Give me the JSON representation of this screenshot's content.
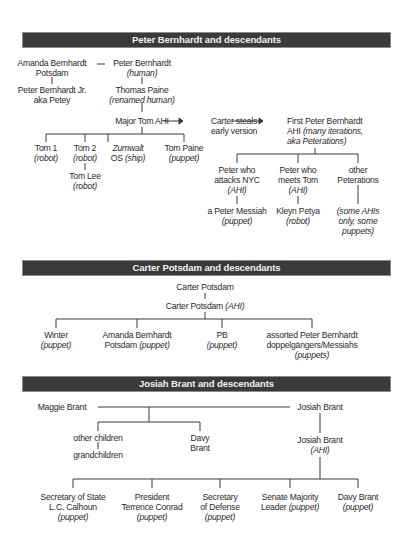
{
  "sections": [
    {
      "title": "Peter Bernhardt and descendants",
      "nodes": {
        "amanda": {
          "line1": "Amanda Bernhardt",
          "line2": "Potsdam"
        },
        "peter": {
          "line1": "Peter Bernhardt",
          "line2": "(human)"
        },
        "peter_jr": {
          "line1": "Peter Bernhardt Jr.",
          "line2": "aka Petey"
        },
        "thomas_paine": {
          "line1": "Thomas Paine",
          "line2": "(renamed human)"
        },
        "major_tom": {
          "line1": "Major Tom AHI"
        },
        "carter_steals": {
          "line1": "Carter steals",
          "line2": "early version"
        },
        "first_peter": {
          "line1": "First Peter Bernhardt",
          "line2a": "AHI ",
          "line2b": "(many iterations,",
          "line3": "aka Peterations)"
        },
        "tom1": {
          "line1": "Tom 1",
          "line2": "(robot)"
        },
        "tom2": {
          "line1": "Tom 2",
          "line2": "(robot)"
        },
        "tom_lee": {
          "line1": "Tom Lee",
          "line2": "(robot)"
        },
        "zumwalt": {
          "line1": "Zumwalt",
          "line2a": "OS ",
          "line2b": "(ship)"
        },
        "tom_paine": {
          "line1": "Tom Paine",
          "line2": "(puppet)"
        },
        "peter_nyc": {
          "line1": "Peter who",
          "line2": "attacks NYC",
          "line3": "(AHI)"
        },
        "peter_tom": {
          "line1": "Peter who",
          "line2": "meets Tom",
          "line3": "(AHI)"
        },
        "other_peterations": {
          "line1": "other",
          "line2": "Peterations"
        },
        "peter_messiah": {
          "line1": "a Peter Messiah",
          "line2": "(puppet)"
        },
        "kleyn_petya": {
          "line1": "Kleyn Petya",
          "line2": "(robot)"
        },
        "some_ahis": {
          "line1": "(some AHIs",
          "line2": "only, some",
          "line3": "puppets)"
        }
      }
    },
    {
      "title": "Carter Potsdam and descendants",
      "nodes": {
        "carter": {
          "line1": "Carter Potsdam"
        },
        "carter_ahi": {
          "line1a": "Carter Potsdam ",
          "line1b": "(AHI)"
        },
        "winter": {
          "line1": "Winter",
          "line2": "(puppet)"
        },
        "amanda_puppet": {
          "line1": "Amanda Bernhardt",
          "line2a": "Potsdam ",
          "line2b": "(puppet)"
        },
        "pb": {
          "line1": "PB",
          "line2": "(puppet)"
        },
        "assorted": {
          "line1": "assorted Peter Bernhardt",
          "line2": "doppelgängers/Messiahs",
          "line3": "(puppets)"
        }
      }
    },
    {
      "title": "Josiah Brant and descendants",
      "nodes": {
        "maggie": {
          "line1": "Maggie Brant"
        },
        "josiah": {
          "line1": "Josiah Brant"
        },
        "other_children": {
          "line1": "other children"
        },
        "grandchildren": {
          "line1": "grandchildren"
        },
        "davy": {
          "line1": "Davy",
          "line2": "Brant"
        },
        "josiah_ahi": {
          "line1": "Josiah Brant",
          "line2": "(AHI)"
        },
        "sec_state": {
          "line1": "Secretary of State",
          "line2": "L.C. Calhoun",
          "line3": "(puppet)"
        },
        "president": {
          "line1": "President",
          "line2": "Terrence Conrad",
          "line3": "(puppet)"
        },
        "sec_defense": {
          "line1": "Secretary",
          "line2": "of Defense",
          "line3": "(puppet)"
        },
        "senate": {
          "line1": "Senate Majority",
          "line2a": "Leader ",
          "line2b": "(puppet)"
        },
        "davy_puppet": {
          "line1": "Davy Brant",
          "line2": "(puppet)"
        }
      }
    }
  ],
  "colors": {
    "header_bg": "#3a3a3a",
    "header_text": "#f2f2f2",
    "line": "#3a3a3a",
    "text": "#2a2a2a"
  }
}
